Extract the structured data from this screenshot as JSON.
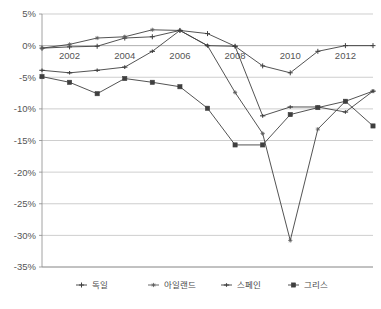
{
  "chart_data": {
    "type": "line",
    "title": "",
    "subtitle": "",
    "xlabel": "",
    "ylabel": "",
    "x": [
      2001,
      2002,
      2003,
      2004,
      2005,
      2006,
      2007,
      2008,
      2009,
      2010,
      2011,
      2012,
      2013
    ],
    "xtick_labels": [
      "2002",
      "2004",
      "2006",
      "2008",
      "2010",
      "2012"
    ],
    "xtick_values": [
      2002,
      2004,
      2006,
      2008,
      2010,
      2012
    ],
    "ytick_labels": [
      "5%",
      "0%",
      "-5%",
      "-10%",
      "-15%",
      "-20%",
      "-25%",
      "-30%",
      "-35%"
    ],
    "ytick_values": [
      5,
      0,
      -5,
      -10,
      -15,
      -20,
      -25,
      -30,
      -35
    ],
    "ylim": [
      -35,
      5
    ],
    "xlim": [
      2001,
      2013
    ],
    "grid": true,
    "grid_axis": "y",
    "legend_position": "bottom",
    "value_unit": "%",
    "series": [
      {
        "name": "독일",
        "marker": "cross",
        "color": "#3f3f3f",
        "values": [
          -0.4,
          -0.2,
          -0.1,
          1.2,
          1.4,
          2.4,
          1.9,
          -0.1,
          -3.2,
          -4.3,
          -0.9,
          0.0,
          0.0
        ]
      },
      {
        "name": "아일랜드",
        "marker": "star",
        "color": "#5a5a5a",
        "values": [
          -0.4,
          0.2,
          1.2,
          1.4,
          2.5,
          2.4,
          0.0,
          -7.4,
          -13.9,
          -30.8,
          -13.2,
          -8.8,
          -7.2
        ]
      },
      {
        "name": "스페인",
        "marker": "plus",
        "color": "#3f3f3f",
        "values": [
          -3.9,
          -4.3,
          -3.9,
          -3.4,
          -0.9,
          2.4,
          0.0,
          -0.1,
          -11.1,
          -9.7,
          -9.7,
          -10.5,
          -7.2
        ]
      },
      {
        "name": "그리스",
        "marker": "square",
        "color": "#3f3f3f",
        "values": [
          -4.9,
          -5.8,
          -7.6,
          -5.2,
          -5.8,
          -6.5,
          -9.9,
          -15.7,
          -15.7,
          -10.9,
          -9.8,
          -8.8,
          -12.7
        ]
      }
    ]
  },
  "legend": {
    "items": [
      {
        "label": "독일"
      },
      {
        "label": "아일랜드"
      },
      {
        "label": "스페인"
      },
      {
        "label": "그리스"
      }
    ]
  },
  "caption": {
    "fragment": ""
  }
}
